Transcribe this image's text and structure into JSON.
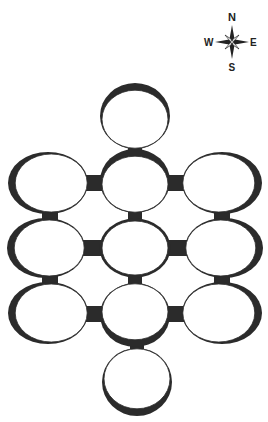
{
  "compass": {
    "north": "N",
    "south": "S",
    "east": "E",
    "west": "W"
  },
  "colors": {
    "wall": "#2b2b2b",
    "floor": "#ffffff"
  },
  "rooms": [
    {
      "id": "top",
      "cx": 135,
      "cy": 118,
      "rx": 33,
      "ry": 29,
      "shade": "top"
    },
    {
      "id": "r1c1",
      "cx": 50,
      "cy": 183,
      "rx": 36,
      "ry": 29,
      "shade": "left"
    },
    {
      "id": "r1c2",
      "cx": 135,
      "cy": 183,
      "rx": 33,
      "ry": 28,
      "shade": "top"
    },
    {
      "id": "r1c3",
      "cx": 220,
      "cy": 183,
      "rx": 36,
      "ry": 29,
      "shade": "right"
    },
    {
      "id": "r2c1",
      "cx": 48,
      "cy": 248,
      "rx": 35,
      "ry": 28,
      "shade": "left"
    },
    {
      "id": "r2c2",
      "cx": 135,
      "cy": 248,
      "rx": 33,
      "ry": 27,
      "shade": "none"
    },
    {
      "id": "r2c3",
      "cx": 222,
      "cy": 248,
      "rx": 35,
      "ry": 28,
      "shade": "right"
    },
    {
      "id": "r3c1",
      "cx": 50,
      "cy": 313,
      "rx": 36,
      "ry": 29,
      "shade": "left"
    },
    {
      "id": "r3c2",
      "cx": 135,
      "cy": 313,
      "rx": 33,
      "ry": 28,
      "shade": "bottom"
    },
    {
      "id": "r3c3",
      "cx": 220,
      "cy": 313,
      "rx": 36,
      "ry": 29,
      "shade": "right"
    },
    {
      "id": "bottom",
      "cx": 137,
      "cy": 380,
      "rx": 33,
      "ry": 30,
      "shade": "bottom"
    }
  ],
  "corridors": [
    {
      "x": 128,
      "y": 143,
      "w": 14,
      "h": 15
    },
    {
      "x": 84,
      "y": 175,
      "w": 20,
      "h": 16
    },
    {
      "x": 168,
      "y": 175,
      "w": 20,
      "h": 16
    },
    {
      "x": 42,
      "y": 208,
      "w": 16,
      "h": 14
    },
    {
      "x": 128,
      "y": 208,
      "w": 14,
      "h": 14
    },
    {
      "x": 214,
      "y": 208,
      "w": 16,
      "h": 14
    },
    {
      "x": 82,
      "y": 240,
      "w": 22,
      "h": 16
    },
    {
      "x": 168,
      "y": 240,
      "w": 20,
      "h": 16
    },
    {
      "x": 42,
      "y": 272,
      "w": 16,
      "h": 16
    },
    {
      "x": 128,
      "y": 272,
      "w": 14,
      "h": 16
    },
    {
      "x": 214,
      "y": 272,
      "w": 16,
      "h": 16
    },
    {
      "x": 84,
      "y": 306,
      "w": 20,
      "h": 16
    },
    {
      "x": 168,
      "y": 306,
      "w": 20,
      "h": 16
    },
    {
      "x": 130,
      "y": 340,
      "w": 14,
      "h": 14
    }
  ]
}
